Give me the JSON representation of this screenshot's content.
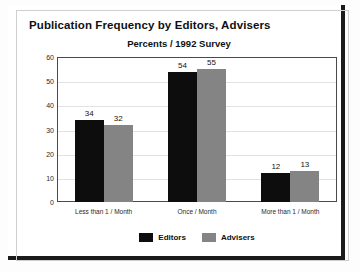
{
  "chart_data": {
    "type": "bar",
    "title": "Publication Frequency by Editors, Advisers",
    "subtitle": "Percents / 1992 Survey",
    "xlabel": "",
    "ylabel": "",
    "ylim": [
      0,
      60
    ],
    "yticks": [
      0,
      10,
      20,
      30,
      40,
      50,
      60
    ],
    "grid": true,
    "legend_position": "bottom",
    "categories": [
      "Less than 1 / Month",
      "Once / Month",
      "More than 1 / Month"
    ],
    "series": [
      {
        "name": "Editors",
        "color": "#0d0d0d",
        "values": [
          34,
          54,
          12
        ]
      },
      {
        "name": "Advisers",
        "color": "#848484",
        "values": [
          32,
          55,
          13
        ]
      }
    ]
  },
  "legend": {
    "items": [
      {
        "label": "Editors"
      },
      {
        "label": "Advisers"
      }
    ]
  }
}
